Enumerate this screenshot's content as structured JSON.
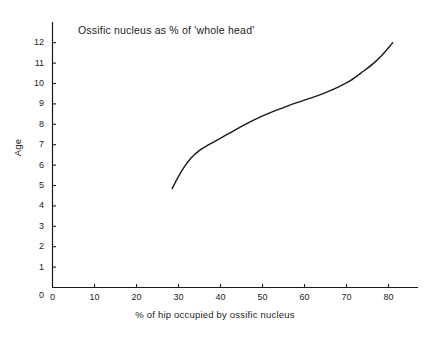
{
  "chart_data": {
    "type": "line",
    "title": "Ossific nucleus as % of 'whole head'",
    "xlabel": "% of hip occupied by ossific nucleus",
    "ylabel": "Age",
    "xlim": [
      0,
      87
    ],
    "ylim": [
      0,
      13
    ],
    "xticks": [
      0,
      10,
      20,
      30,
      40,
      50,
      60,
      70,
      80
    ],
    "yticks": [
      0,
      1,
      2,
      3,
      4,
      5,
      6,
      7,
      8,
      9,
      10,
      11,
      12
    ],
    "xtick_labels": [
      "0",
      "10",
      "20",
      "30",
      "40",
      "50",
      "60",
      "70",
      "80"
    ],
    "ytick_labels": [
      "0",
      "1",
      "2",
      "3",
      "4",
      "5",
      "6",
      "7",
      "8",
      "9",
      "10",
      "11",
      "12"
    ],
    "grid": false,
    "legend": false,
    "series": [
      {
        "name": "Ossific nucleus vs age",
        "color": "#1a1a1a",
        "x": [
          28.5,
          30.0,
          31.5,
          33.0,
          35.0,
          37.0,
          39.0,
          42.0,
          45.0,
          48.0,
          51.0,
          55.0,
          58.0,
          62.0,
          65.0,
          68.0,
          71.0,
          74.0,
          76.5,
          78.5,
          80.0,
          81.0
        ],
        "y": [
          4.85,
          5.45,
          5.95,
          6.35,
          6.72,
          6.98,
          7.2,
          7.55,
          7.9,
          8.22,
          8.5,
          8.82,
          9.05,
          9.32,
          9.55,
          9.82,
          10.15,
          10.6,
          11.0,
          11.4,
          11.75,
          12.0
        ]
      }
    ]
  },
  "axes": {
    "title": "Ossific nucleus as % of 'whole head'",
    "x_label": "% of hip occupied by ossific nucleus",
    "y_label": "Age"
  }
}
